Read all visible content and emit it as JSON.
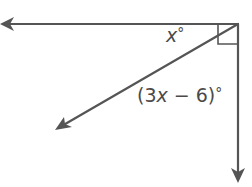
{
  "diagram": {
    "type": "angle-diagram",
    "vertex": {
      "x": 238,
      "y": 24
    },
    "rays": [
      {
        "name": "left-ray",
        "to": {
          "x": 2,
          "y": 24
        }
      },
      {
        "name": "down-ray",
        "to": {
          "x": 238,
          "y": 182
        }
      },
      {
        "name": "diagonal-ray",
        "to": {
          "x": 55,
          "y": 130
        }
      }
    ],
    "right_angle_marker": true,
    "labels": {
      "angle_top": {
        "var": "x",
        "deg": "°"
      },
      "angle_bottom": {
        "open": "(3",
        "var": "x",
        "rest": " − 6)",
        "deg": "°"
      }
    },
    "stroke_color": "#555555"
  }
}
